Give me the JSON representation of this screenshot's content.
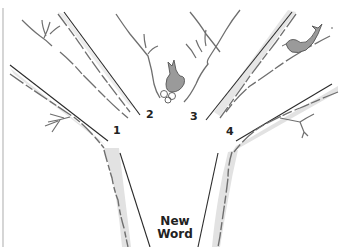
{
  "diagram": {
    "type": "tree-branches",
    "branch_labels": [
      "1",
      "2",
      "3",
      "4"
    ],
    "trunk_label_line1": "New",
    "trunk_label_line2": "Word",
    "colors": {
      "outline": "#2a2a2a",
      "sketch": "#6f6f6f",
      "shade": "#dcdcdc",
      "bird": "#9a9a9a",
      "border": "#bdbdbd"
    },
    "decorations": [
      "bird-left-fork",
      "bird-right-branch"
    ]
  }
}
